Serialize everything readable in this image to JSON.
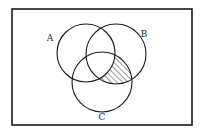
{
  "diagram": {
    "type": "venn",
    "frame": {
      "x": 12,
      "y": 9,
      "width": 180,
      "height": 116
    },
    "sets": [
      {
        "id": "A",
        "label": "A",
        "cx": 86,
        "cy": 53,
        "r": 29,
        "label_x": 50,
        "label_y": 41
      },
      {
        "id": "B",
        "label": "B",
        "cx": 116,
        "cy": 54,
        "r": 30,
        "label_x": 144,
        "label_y": 37
      },
      {
        "id": "C",
        "label": "C",
        "cx": 102,
        "cy": 82,
        "r": 30,
        "label_x": 102,
        "label_y": 120
      }
    ],
    "shaded_region": "B ∩ C ∩ A'",
    "shading_style": "diagonal-hatch",
    "colors": {
      "stroke": "#1a1a1a",
      "background": "#ffffff"
    }
  }
}
